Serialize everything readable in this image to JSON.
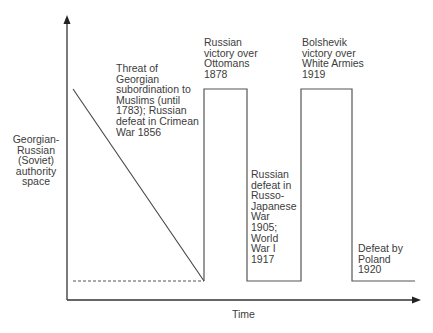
{
  "diagram": {
    "y_axis_label": "Georgian-\nRussian\n(Soviet)\nauthority\nspace",
    "x_axis_label": "Time",
    "annotations": [
      {
        "id": "threat",
        "text": "Threat of\nGeorgian\nsubordination to\nMuslims (until\n1783); Russian\ndefeat in Crimean\nWar 1856"
      },
      {
        "id": "ottomans",
        "text": "Russian\nvictory over\nOttomans\n1878"
      },
      {
        "id": "russo-japanese",
        "text": "Russian\ndefeat in\nRusso-\nJapanese\nWar\n1905;\nWorld\nWar I\n1917"
      },
      {
        "id": "bolshevik",
        "text": "Bolshevik\nvictory over\nWhite Armies\n1919"
      },
      {
        "id": "poland",
        "text": "Defeat by\nPoland\n1920"
      }
    ],
    "colors": {
      "line": "#444444",
      "text": "#3c3c3c",
      "background": "#ffffff"
    }
  }
}
